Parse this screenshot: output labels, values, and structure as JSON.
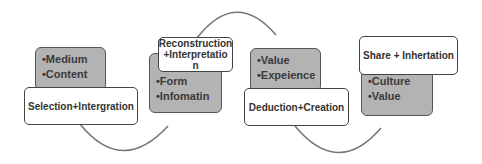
{
  "diagram": {
    "stages": [
      {
        "title": "Selection+Intergration",
        "items": [
          "•Medium",
          "•Content"
        ]
      },
      {
        "title": "Reconstruction\n+Interpretatio\nn",
        "title_lines": [
          "Reconstruction",
          "+Interpretatio",
          "n"
        ],
        "items": [
          "•Form",
          "•Infomatin"
        ]
      },
      {
        "title": "Deduction+Creation",
        "items": [
          "•Value",
          "•Expeience"
        ]
      },
      {
        "title": "Share + Inhertation",
        "items": [
          "•Culture",
          "•Value"
        ]
      }
    ],
    "colors": {
      "detail_fill": "#b3b3b3",
      "title_fill": "#ffffff",
      "border": "#444444",
      "arc": "#777777"
    }
  }
}
